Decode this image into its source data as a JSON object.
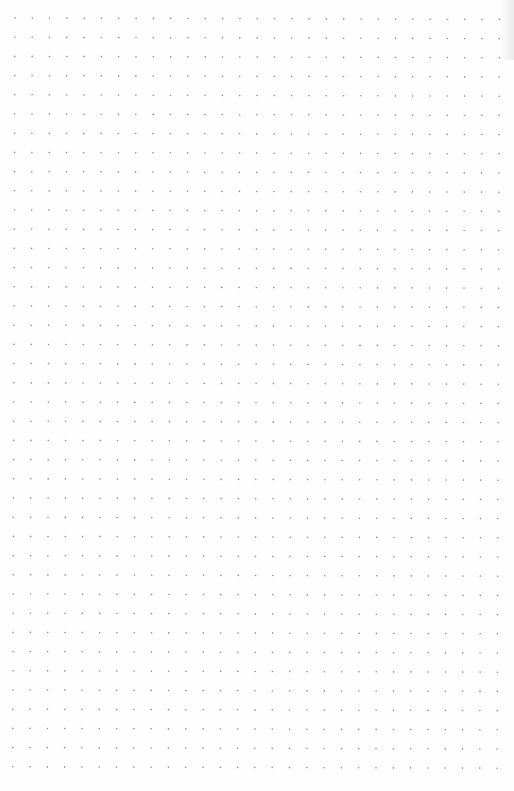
{
  "page": {
    "type": "dot-grid-paper",
    "background_color": "#fefefe",
    "dot_color": "#8a8a8a"
  },
  "grid": {
    "columns": 29,
    "rows": 40,
    "origin_x": 15,
    "origin_y": 18,
    "spacing_x": 17.3,
    "spacing_y": 19.2,
    "dot_radius": 0.8
  }
}
